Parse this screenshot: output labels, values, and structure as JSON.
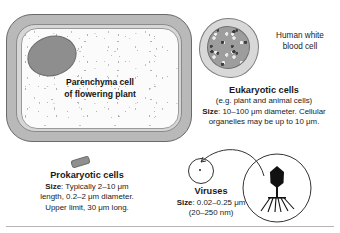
{
  "figure": {
    "plant_cell": {
      "label_line1": "Parenchyma cell",
      "label_line2": "of flowering plant",
      "organelle_names": [
        "nucleus",
        "cell-wall",
        "cytoplasm"
      ]
    },
    "white_blood_cell": {
      "label_line1": "Human white",
      "label_line2": "blood cell"
    },
    "eukaryotes": {
      "title": "Eukaryotic cells",
      "subtitle": "(e.g. plant and animal cells)",
      "size_label": "Size",
      "size_line1": ": 10–100 μm diameter. Cellular",
      "size_line2": "organelles may be up to 10 μm."
    },
    "prokaryotes": {
      "title": "Prokaryotic cells",
      "size_label": "Size",
      "size_line1": ": Typically 2–10 μm",
      "line2": "length, 0.2–2 μm diameter.",
      "line3": "Upper limit, 30 μm long."
    },
    "viruses": {
      "title": "Viruses",
      "size_label": "Size",
      "size_line1": ": 0.02–0.25 μm",
      "size_line2": "(20–250 nm)",
      "magnified_item": "bacteriophage"
    },
    "colors": {
      "cell_wall_outer": "#b9b9b9",
      "cell_wall_inner": "#d6d6d6",
      "cytoplasm": "#fbfbfb",
      "nucleus": "#8e8e8e",
      "outline": "#6a6a6a",
      "text": "#1a1a1a",
      "phage": "#111111"
    }
  }
}
